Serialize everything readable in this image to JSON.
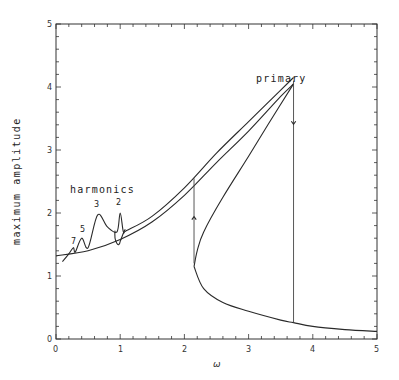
{
  "chart_data": {
    "type": "line",
    "title": "",
    "xlabel": "ω",
    "ylabel": "maximum amplitude",
    "xlim": [
      0,
      5
    ],
    "ylim": [
      0,
      5
    ],
    "x_ticks": [
      0,
      1,
      2,
      3,
      4,
      5
    ],
    "y_ticks": [
      0,
      1,
      2,
      3,
      4,
      5
    ],
    "x_minor_step": 0.2,
    "y_minor_step": 0.2,
    "grid": false,
    "legend": null,
    "annotations": [
      {
        "text": "primary",
        "x": 3.2,
        "y": 4.25
      },
      {
        "text": "harmonics",
        "x": 0.55,
        "y": 2.2
      },
      {
        "text": "7",
        "x": 0.27,
        "y": 1.52
      },
      {
        "text": "5",
        "x": 0.42,
        "y": 1.7
      },
      {
        "text": "3",
        "x": 0.64,
        "y": 2.1
      },
      {
        "text": "2",
        "x": 1.0,
        "y": 2.1
      }
    ],
    "series": [
      {
        "name": "lower stable branch (harmonic region to resonance)",
        "x": [
          0.0,
          0.5,
          1.0,
          1.5,
          2.0,
          2.5,
          3.0,
          3.5,
          3.7
        ],
        "y": [
          1.32,
          1.4,
          1.58,
          1.86,
          2.28,
          2.8,
          3.3,
          3.85,
          4.05
        ]
      },
      {
        "name": "upper stable branch (with harmonic peaks)",
        "x": [
          0.1,
          0.2,
          0.27,
          0.3,
          0.4,
          0.5,
          0.65,
          0.8,
          0.95,
          1.0,
          1.05,
          1.1,
          1.5,
          2.0,
          2.5,
          3.0,
          3.5,
          3.7
        ],
        "y": [
          1.23,
          1.35,
          1.45,
          1.38,
          1.6,
          1.45,
          1.97,
          1.78,
          1.7,
          2.0,
          1.7,
          1.72,
          1.95,
          2.4,
          2.95,
          3.45,
          3.95,
          4.15
        ]
      },
      {
        "name": "unstable middle branch",
        "x": [
          3.7,
          3.3,
          3.0,
          2.6,
          2.3,
          2.2,
          2.15
        ],
        "y": [
          4.05,
          3.4,
          2.9,
          2.25,
          1.7,
          1.4,
          1.15
        ]
      },
      {
        "name": "low-amplitude branch",
        "x": [
          2.15,
          2.3,
          2.6,
          3.0,
          3.5,
          3.7,
          4.0,
          4.5,
          5.0
        ],
        "y": [
          1.15,
          0.8,
          0.58,
          0.44,
          0.3,
          0.26,
          0.2,
          0.15,
          0.12
        ]
      },
      {
        "name": "jump up",
        "x": [
          2.15,
          2.15
        ],
        "y": [
          1.2,
          2.55
        ],
        "style": "arrow-up"
      },
      {
        "name": "jump down",
        "x": [
          3.7,
          3.7
        ],
        "y": [
          4.1,
          0.26
        ],
        "style": "arrow-down"
      }
    ]
  },
  "labels": {
    "ylabel": "maximum amplitude",
    "xlabel": "ω",
    "primary": "primary",
    "harmonics": "harmonics",
    "h7": "7",
    "h5": "5",
    "h3": "3",
    "h2": "2",
    "x0": "0",
    "x1": "1",
    "x2": "2",
    "x3": "3",
    "x4": "4",
    "x5": "5",
    "y0": "0",
    "y1": "1",
    "y2": "2",
    "y3": "3",
    "y4": "4",
    "y5": "5"
  }
}
